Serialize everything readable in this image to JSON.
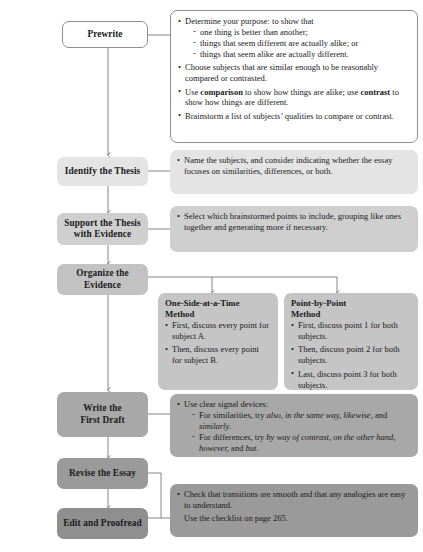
{
  "diagram": {
    "type": "process-flowchart"
  },
  "colors": {
    "page_background": "#ffffff",
    "box_border": "#8e8e8e",
    "connector": "#6f6f6f",
    "text": "#1a1a1a",
    "stage_white": "#ffffff",
    "stage_shade_1": "#e4e4e4",
    "stage_shade_2": "#cfcfcf",
    "stage_shade_3": "#c2c2c2",
    "stage_shade_4": "#a8a8a8",
    "stage_shade_5": "#9a9a9a",
    "stage_shade_6": "#8f8f8f",
    "panel_shade_1": "#e4e4e4",
    "panel_shade_2": "#cfcfcf",
    "panel_shade_3": "#c5c5c5",
    "panel_shade_4": "#a8a8a8",
    "panel_shade_5": "#9a9a9a"
  },
  "stages": [
    {
      "id": "prewrite",
      "label": "Prewrite"
    },
    {
      "id": "thesis",
      "label": "Identify the Thesis"
    },
    {
      "id": "support",
      "line1": "Support the Thesis",
      "line2": "with Evidence"
    },
    {
      "id": "organize",
      "line1": "Organize the",
      "line2": "Evidence"
    },
    {
      "id": "draft",
      "line1": "Write the",
      "line2": "First Draft"
    },
    {
      "id": "revise",
      "label": "Revise the Essay"
    },
    {
      "id": "edit",
      "label": "Edit and Proofread"
    }
  ],
  "panels": {
    "prewrite": {
      "bullets": [
        {
          "text": "Determine your purpose: to show that",
          "dashes": [
            "one thing is better than another;",
            "things that seem different are actually alike; or",
            "things that seem alike are actually different."
          ]
        },
        {
          "text": "Choose subjects that are similar enough to be reasonably compared or contrasted."
        },
        {
          "rich": true,
          "pre": "Use ",
          "bold1": "comparison",
          "mid": " to show how things are alike; use ",
          "bold2": "contrast",
          "post": " to show how things are different."
        },
        {
          "text": "Brainstorm a list of subjects’ qualities to compare or contrast."
        }
      ]
    },
    "thesis": {
      "bullets": [
        {
          "text": "Name the subjects, and consider indicating whether the essay focuses on similarities, differences, or both."
        }
      ]
    },
    "support": {
      "bullets": [
        {
          "text": "Select which brainstormed points to include, grouping like ones together and generating more if necessary."
        }
      ]
    },
    "method_one_side": {
      "heading_line1": "One-Side-at-a-Time",
      "heading_line2": "Method",
      "bullets": [
        "First, discuss every point for subject A.",
        "Then, discuss every point for subject B."
      ]
    },
    "method_point_by_point": {
      "heading_line1": "Point-by-Point",
      "heading_line2": "Method",
      "bullets": [
        "First, discuss point 1 for both subjects.",
        "Then, discuss point 2 for both subjects.",
        "Last, discuss point 3 for both subjects."
      ]
    },
    "draft": {
      "lead": "Use clear signal devices:",
      "dashes": [
        {
          "pre": "For similarities, try ",
          "italic": "also, in the same way, likewise,",
          "mid": " and ",
          "italic2": "similarly",
          "post": "."
        },
        {
          "pre": "For differences, try ",
          "italic": "by way of contrast, on the other hand, however,",
          "mid": " and ",
          "italic2": "but",
          "post": "."
        }
      ]
    },
    "edit": {
      "bullets": [
        {
          "text": "Check that transitions are smooth and that any analogies are easy to understand."
        }
      ],
      "note": "Use the checklist on page 265."
    }
  }
}
